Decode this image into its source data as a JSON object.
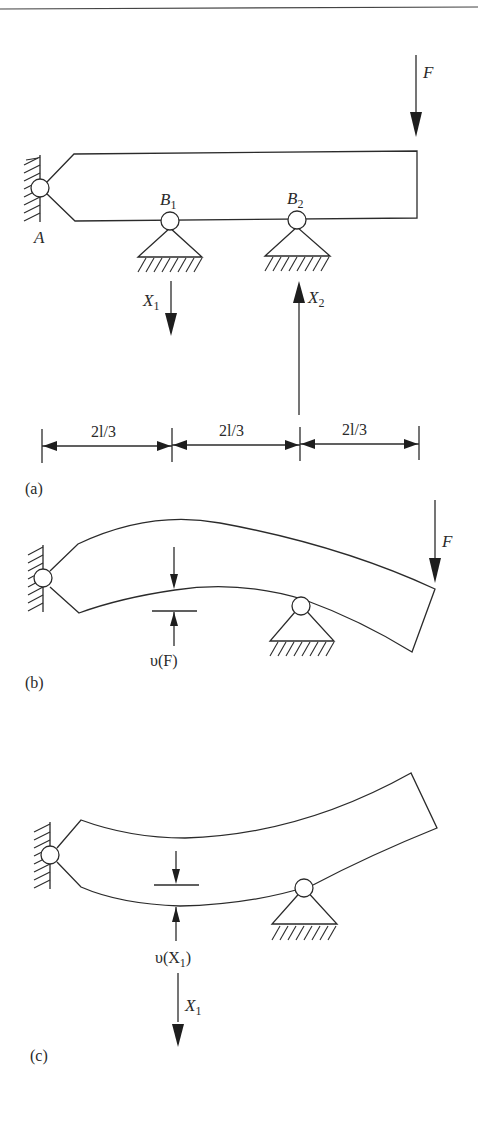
{
  "figure": {
    "panels": [
      {
        "id": "a",
        "caption": "(a)",
        "labels": {
          "support_A": "A",
          "support_B1": "B",
          "support_B1_sub": "1",
          "support_B2": "B",
          "support_B2_sub": "2",
          "force_F": "F",
          "reaction_X1": "X",
          "reaction_X1_sub": "1",
          "reaction_X2": "X",
          "reaction_X2_sub": "2"
        },
        "dimensions": [
          "2l/3",
          "2l/3",
          "2l/3"
        ]
      },
      {
        "id": "b",
        "caption": "(b)",
        "labels": {
          "force_F": "F",
          "deflection": "υ(F)"
        }
      },
      {
        "id": "c",
        "caption": "(c)",
        "labels": {
          "deflection_prefix": "υ(X",
          "deflection_sub": "1",
          "deflection_suffix": ")",
          "reaction_X1": "X",
          "reaction_X1_sub": "1"
        }
      }
    ]
  }
}
